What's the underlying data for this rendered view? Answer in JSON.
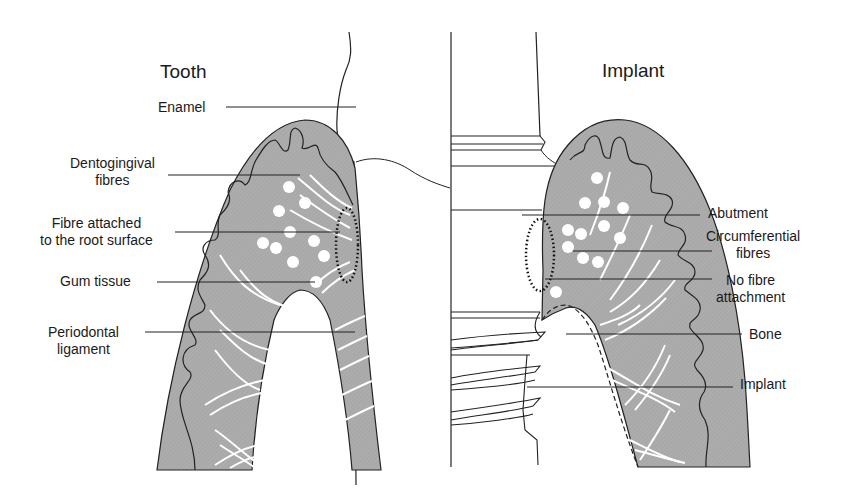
{
  "titles": {
    "left": "Tooth",
    "right": "Implant"
  },
  "left_labels": [
    {
      "id": "enamel",
      "line1": "Enamel",
      "line2": ""
    },
    {
      "id": "dentogingival",
      "line1": "Dentogingival",
      "line2": "fibres"
    },
    {
      "id": "fibre-attached",
      "line1": "Fibre attached",
      "line2": "to the root surface"
    },
    {
      "id": "gum-tissue",
      "line1": "Gum tissue",
      "line2": ""
    },
    {
      "id": "periodontal",
      "line1": "Periodontal",
      "line2": "ligament"
    }
  ],
  "right_labels": [
    {
      "id": "abutment",
      "line1": "Abutment",
      "line2": ""
    },
    {
      "id": "circumferential",
      "line1": "Circumferential",
      "line2": "fibres"
    },
    {
      "id": "no-fibre",
      "line1": "No fibre",
      "line2": "attachment"
    },
    {
      "id": "bone",
      "line1": "Bone",
      "line2": ""
    },
    {
      "id": "implant",
      "line1": "Implant",
      "line2": ""
    }
  ],
  "colors": {
    "tissue": "#a9a9a9",
    "outline": "#2a2a2a",
    "fibre": "#ffffff",
    "background": "#ffffff"
  }
}
